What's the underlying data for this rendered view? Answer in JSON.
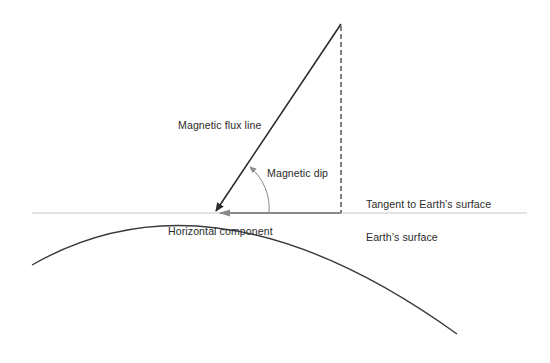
{
  "diagram": {
    "labels": {
      "flux_line": "Magnetic flux line",
      "dip": "Magnetic dip",
      "tangent": "Tangent to Earth’s surface",
      "horizontal": "Horizontal component",
      "surface": "Earth’s surface"
    },
    "colors": {
      "flux_line": "#2b2b2b",
      "tangent": "#c8c8c8",
      "horizontal_arrow": "#8a8a8a",
      "dashed_vertical": "#2b2b2b",
      "earth_surface": "#3a3a3a",
      "dip_arc": "#8a8a8a",
      "text": "#2b2b2b"
    }
  }
}
